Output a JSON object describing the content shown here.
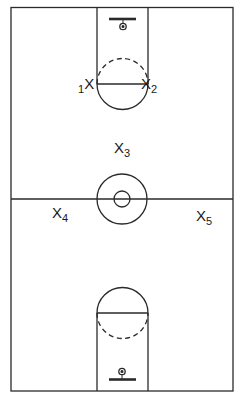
{
  "diagram": {
    "title": "",
    "type": "basketball half-court / full-court play diagram",
    "colors": {
      "line": "#2a2a2a",
      "background": "#ffffff"
    },
    "court": {
      "outline": {
        "x": 11,
        "y": 7,
        "width": 222,
        "height": 384
      },
      "midcourt_line_y": 199,
      "center_circle": {
        "cx": 122,
        "cy": 199,
        "outer_r": 25,
        "inner_r": 8
      },
      "top_key": {
        "lane": {
          "x": 97,
          "y": 7,
          "width": 51,
          "height": 77
        },
        "free_throw_line_y": 84,
        "circle": {
          "cx": 122.5,
          "cy": 84,
          "r": 25.5,
          "upper_half": "dashed",
          "lower_half": "solid"
        },
        "backboard": {
          "x1": 109,
          "x2": 136,
          "y": 19
        },
        "hoop": {
          "cx": 123,
          "cy": 26,
          "r": 3
        }
      },
      "bottom_key": {
        "lane": {
          "x": 97,
          "y": 313,
          "width": 51,
          "height": 78
        },
        "free_throw_line_y": 313,
        "circle": {
          "cx": 122.5,
          "cy": 313,
          "r": 25.5,
          "upper_half": "solid",
          "lower_half": "dashed"
        },
        "backboard": {
          "x1": 109,
          "x2": 136,
          "y": 380
        },
        "hoop": {
          "cx": 122,
          "cy": 372,
          "r": 3
        }
      }
    },
    "players": [
      {
        "id": "player-1",
        "mark": "X",
        "number": "1",
        "number_position": "before",
        "x": 78,
        "y": 76
      },
      {
        "id": "player-2",
        "mark": "X",
        "number": "2",
        "number_position": "after",
        "x": 142,
        "y": 76
      },
      {
        "id": "player-3",
        "mark": "X",
        "number": "3",
        "number_position": "after",
        "x": 114,
        "y": 140
      },
      {
        "id": "player-4",
        "mark": "X",
        "number": "4",
        "number_position": "after",
        "x": 52,
        "y": 205
      },
      {
        "id": "player-5",
        "mark": "X",
        "number": "5",
        "number_position": "after",
        "x": 196,
        "y": 208
      }
    ]
  }
}
